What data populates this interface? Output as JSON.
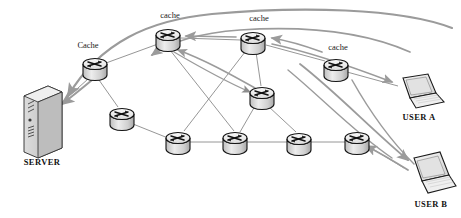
{
  "diagram": {
    "background_color": "#ffffff",
    "width": 461,
    "height": 218,
    "colors": {
      "node_outline": "#1a1a1a",
      "node_fill_top": "#f0f0f0",
      "node_fill_body": "#d8d8d8",
      "link_line": "#8a8a8a",
      "flow_arrow": "#9b9b9b",
      "server_fill": "#c9c9c9",
      "laptop_fill": "#e8e8e8",
      "text": "#111111"
    },
    "labels": {
      "server": "SERVER",
      "user_a": "USER A",
      "user_b": "USER B",
      "cache_upper": "Cache",
      "cache_top_left": "cache",
      "cache_top_right": "cache",
      "cache_right": "cache"
    },
    "nodes": [
      {
        "id": "server",
        "name": "server-tower",
        "type": "server",
        "label": "SERVER",
        "x": 42,
        "y": 119
      },
      {
        "id": "cache1",
        "name": "router-cache-1",
        "type": "router",
        "label": "Cache",
        "x": 95,
        "y": 68
      },
      {
        "id": "cache2",
        "name": "router-cache-2",
        "type": "router",
        "label": "cache",
        "x": 168,
        "y": 38
      },
      {
        "id": "cache3",
        "name": "router-cache-3",
        "type": "router",
        "label": "cache",
        "x": 253,
        "y": 41
      },
      {
        "id": "cache4",
        "name": "router-cache-4",
        "type": "router",
        "label": "cache",
        "x": 336,
        "y": 68
      },
      {
        "id": "core_mid",
        "name": "router-core-mid",
        "type": "router",
        "label": "",
        "x": 262,
        "y": 96
      },
      {
        "id": "r_left",
        "name": "router-left",
        "type": "router",
        "label": "",
        "x": 122,
        "y": 117
      },
      {
        "id": "r_b1",
        "name": "router-bottom-1",
        "type": "router",
        "label": "",
        "x": 178,
        "y": 141
      },
      {
        "id": "r_b2",
        "name": "router-bottom-2",
        "type": "router",
        "label": "",
        "x": 235,
        "y": 141
      },
      {
        "id": "r_b3",
        "name": "router-bottom-3",
        "type": "router",
        "label": "",
        "x": 299,
        "y": 142
      },
      {
        "id": "r_b4",
        "name": "router-bottom-4",
        "type": "router",
        "label": "",
        "x": 357,
        "y": 141
      },
      {
        "id": "user_a",
        "name": "laptop-user-a",
        "type": "laptop",
        "label": "USER A",
        "x": 415,
        "y": 92
      },
      {
        "id": "user_b",
        "name": "laptop-user-b",
        "type": "laptop",
        "label": "USER B",
        "x": 427,
        "y": 176
      }
    ],
    "links": [
      {
        "from": "server",
        "to": "cache1",
        "name": "link-server-cache1"
      },
      {
        "from": "cache1",
        "to": "cache2",
        "name": "link-cache1-cache2"
      },
      {
        "from": "cache1",
        "to": "r_left",
        "name": "link-cache1-rleft"
      },
      {
        "from": "cache2",
        "to": "cache3",
        "name": "link-cache2-cache3"
      },
      {
        "from": "cache2",
        "to": "r_b2",
        "name": "link-cache2-rb2"
      },
      {
        "from": "cache3",
        "to": "cache4",
        "name": "link-cache3-cache4"
      },
      {
        "from": "cache3",
        "to": "core_mid",
        "name": "link-cache3-coremid"
      },
      {
        "from": "cache3",
        "to": "r_b1",
        "name": "link-cache3-rb1"
      },
      {
        "from": "cache4",
        "to": "user_a",
        "name": "link-cache4-usera"
      },
      {
        "from": "core_mid",
        "to": "r_b2",
        "name": "link-coremid-rb2"
      },
      {
        "from": "core_mid",
        "to": "r_b3",
        "name": "link-coremid-rb3"
      },
      {
        "from": "r_left",
        "to": "r_b1",
        "name": "link-rleft-rb1"
      },
      {
        "from": "r_b1",
        "to": "r_b2",
        "name": "link-rb1-rb2"
      },
      {
        "from": "r_b2",
        "to": "r_b3",
        "name": "link-rb2-rb3"
      },
      {
        "from": "r_b3",
        "to": "r_b4",
        "name": "link-rb3-rb4"
      },
      {
        "from": "r_b4",
        "to": "user_b",
        "name": "link-rb4-userb"
      }
    ],
    "flows": [
      {
        "id": "req_a_top",
        "name": "flow-user-a-request-to-server",
        "from": "user_a",
        "to": "server",
        "direction": "leftward"
      },
      {
        "id": "req_a_inner",
        "name": "flow-user-a-inner-request",
        "from": "user_a",
        "to": "cache1",
        "direction": "leftward"
      },
      {
        "id": "resp_a",
        "name": "flow-response-to-user-a",
        "from": "cache4",
        "to": "user_a",
        "direction": "rightward"
      },
      {
        "id": "req_b",
        "name": "flow-user-b-request",
        "from": "user_b",
        "to": "r_b4",
        "direction": "leftward"
      },
      {
        "id": "resp_b",
        "name": "flow-response-to-user-b",
        "from": "r_b4",
        "to": "user_b",
        "direction": "rightward"
      },
      {
        "id": "mid_up",
        "name": "flow-core-mid-upstream",
        "from": "core_mid",
        "to": "cache2",
        "direction": "upward"
      },
      {
        "id": "cache_down",
        "name": "flow-cache2-downstream",
        "from": "cache2",
        "to": "core_mid",
        "direction": "downward"
      }
    ]
  }
}
